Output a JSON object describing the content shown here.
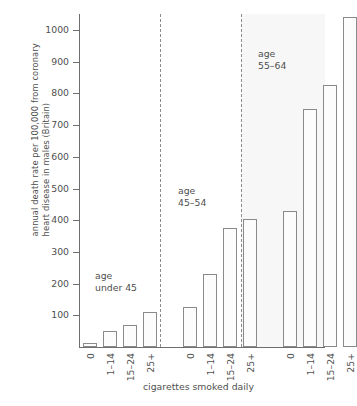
{
  "chart_data": {
    "type": "bar",
    "title": "",
    "xlabel": "cigarettes smoked daily",
    "ylabel": "annual death rate per 100,000 from coronary\nheart disease in males (Britain)",
    "ylim": [
      0,
      1080
    ],
    "yticks": [
      100,
      200,
      300,
      400,
      500,
      600,
      700,
      800,
      900,
      1000
    ],
    "ytick_labels": [
      "100",
      "200",
      "300",
      "400",
      "500",
      "600",
      "700",
      "800",
      "900",
      "1000"
    ],
    "grid": false,
    "legend": "none",
    "categories": [
      "0",
      "1-14",
      "15-24",
      "25+"
    ],
    "groups": [
      {
        "name": "age under 45",
        "label_lines": "age\nunder 45",
        "categories": [
          "0",
          "1-14",
          "15-24",
          "25+"
        ],
        "values": [
          14,
          50,
          70,
          110
        ]
      },
      {
        "name": "age 45-54",
        "label_lines": "age\n45–54",
        "categories": [
          "0",
          "1-14",
          "15-24",
          "25+"
        ],
        "values": [
          126,
          230,
          375,
          405
        ]
      },
      {
        "name": "age 55-64",
        "label_lines": "age\n55–64",
        "categories": [
          "0",
          "1-14",
          "15-24",
          "25+"
        ],
        "values": [
          430,
          750,
          825,
          1040
        ]
      }
    ],
    "xtick_labels": [
      "0",
      "1–14",
      "15–24",
      "25+",
      "0",
      "1–14",
      "15–24",
      "25+",
      "0",
      "1–14",
      "15–24",
      "25+"
    ],
    "colors": {
      "bar_fill": "#fcfcfc",
      "bar_stroke": "#8a8a8a",
      "axis": "#6e6e6e",
      "divider": "#8c8c8c",
      "band_fill": "#f7f7f7",
      "text": "#4f4f4f"
    }
  }
}
